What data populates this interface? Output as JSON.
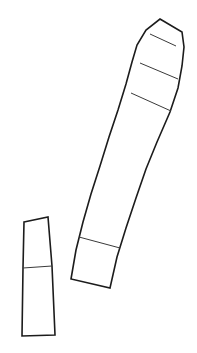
{
  "figure": {
    "type": "line-drawing",
    "background_color": "#ffffff",
    "outline_color": "#1c1c1c",
    "divider_color": "#3a3a3a",
    "fill_color": "#ffffff",
    "outline_stroke_width": 1.6,
    "divider_stroke_width": 1.0,
    "canvas": {
      "width": 197,
      "height": 353
    },
    "shape_count": 2,
    "shapes": [
      {
        "id": "curved-strip",
        "label": "Curved segmented strip",
        "segment_count": 5,
        "outline_points": "160,19 182,32 184,47 182,66 178,88 170,112 157,142 146,169 136,198 126,228 117,257 110,288 71,279 76,250 83,222 91,194 100,166 109,137 118,110 126,84 132,62 137,45 146,30",
        "dividers": [
          {
            "id": "divider-1",
            "points": "150,34 176,46"
          },
          {
            "id": "divider-2",
            "points": "140,63 178,79"
          },
          {
            "id": "divider-3",
            "points": "131,93 171,111"
          },
          {
            "id": "divider-4",
            "points": "79,237 120,248"
          }
        ]
      },
      {
        "id": "straight-strip",
        "label": "Straight segmented strip",
        "segment_count": 2,
        "outline_points": "24,222 48,217 52,266 55,335 22,336 23,268",
        "dividers": [
          {
            "id": "divider-1",
            "points": "23,268 52,266"
          }
        ]
      }
    ]
  }
}
